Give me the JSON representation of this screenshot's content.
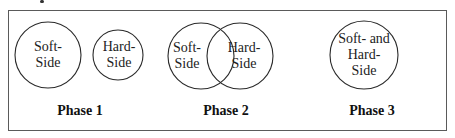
{
  "diagram": {
    "phases": [
      {
        "label": "Phase 1",
        "circles": [
          {
            "lines": [
              "Soft-",
              "Side"
            ]
          },
          {
            "lines": [
              "Hard-",
              "Side"
            ]
          }
        ]
      },
      {
        "label": "Phase 2",
        "circles": [
          {
            "lines": [
              "Soft-",
              "Side"
            ]
          },
          {
            "lines": [
              "Hard-",
              "Side"
            ]
          }
        ]
      },
      {
        "label": "Phase 3",
        "circles": [
          {
            "lines": [
              "Soft- and",
              "Hard-",
              "Side"
            ]
          }
        ]
      }
    ],
    "colors": {
      "stroke": "#2a2a2a",
      "frame": "#5a5a5a",
      "background": "#ffffff"
    }
  }
}
